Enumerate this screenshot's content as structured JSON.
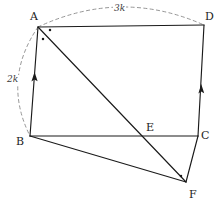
{
  "figure": {
    "type": "geometry-diagram",
    "width": 219,
    "height": 205,
    "background_color": "#ffffff",
    "stroke_color": "#1a1a1a",
    "dashed_color": "#8a8a8a"
  },
  "vertices": [
    {
      "name": "A",
      "label": "A",
      "x": 38,
      "y": 27,
      "label_x": 30,
      "label_y": 11
    },
    {
      "name": "D",
      "label": "D",
      "x": 204,
      "y": 25,
      "label_x": 205,
      "label_y": 11
    },
    {
      "name": "B",
      "label": "B",
      "x": 30,
      "y": 136,
      "label_x": 16,
      "label_y": 136
    },
    {
      "name": "C",
      "label": "C",
      "x": 198,
      "y": 136,
      "label_x": 201,
      "label_y": 130
    },
    {
      "name": "E",
      "label": "E",
      "x": 152,
      "y": 136,
      "label_x": 146,
      "label_y": 122
    },
    {
      "name": "F",
      "label": "F",
      "x": 186,
      "y": 182,
      "label_x": 189,
      "label_y": 189
    }
  ],
  "segments": [
    {
      "name": "segment-AD",
      "from": "A",
      "to": "D"
    },
    {
      "name": "segment-BA",
      "from": "B",
      "to": "A",
      "tick": "single-arrow"
    },
    {
      "name": "segment-CD",
      "from": "C",
      "to": "D",
      "tick": "single-arrow"
    },
    {
      "name": "segment-BC",
      "from": "B",
      "to": "C"
    },
    {
      "name": "segment-AF",
      "from": "A",
      "to": "F"
    },
    {
      "name": "segment-BF",
      "from": "B",
      "to": "F"
    },
    {
      "name": "segment-CF",
      "from": "C",
      "to": "F"
    }
  ],
  "arcs": [
    {
      "name": "arc-measure-AD",
      "label": "3k",
      "from": "A",
      "to": "D",
      "label_x": 113,
      "label_y": 4
    },
    {
      "name": "arc-measure-AB",
      "label": "2k",
      "from": "A",
      "to": "B",
      "label_x": 6,
      "label_y": 75
    }
  ],
  "angle_marks": [
    {
      "name": "angle-dot-A-upper",
      "x": 50,
      "y": 30
    },
    {
      "name": "angle-dot-A-lower",
      "x": 43,
      "y": 39
    },
    {
      "name": "angle-dot-F",
      "x": 181,
      "y": 176
    }
  ]
}
